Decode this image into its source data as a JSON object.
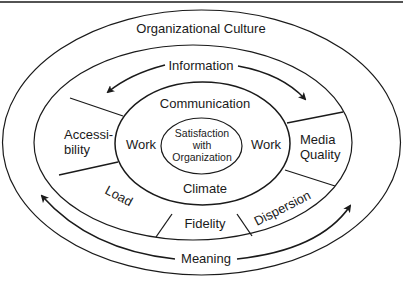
{
  "diagram": {
    "type": "concentric-ellipse",
    "colors": {
      "line": "#1a1a1a",
      "background": "#ffffff"
    },
    "rings": {
      "outer": {
        "label": "Organizational Culture"
      },
      "second": {
        "arrow_top": {
          "label": "Information",
          "direction": "bidirectional"
        },
        "arrow_bottom": {
          "label": "Meaning",
          "direction": "bidirectional"
        }
      },
      "middle_band": {
        "segments": [
          {
            "id": "accessibility",
            "line1": "Accessi-",
            "line2": "bility"
          },
          {
            "id": "media-quality",
            "line1": "Media",
            "line2": "Quality"
          },
          {
            "id": "load",
            "label": "Load"
          },
          {
            "id": "fidelity",
            "label": "Fidelity"
          },
          {
            "id": "dispersion",
            "label": "Dispersion"
          }
        ]
      },
      "inner": {
        "top": "Communication",
        "bottom": "Climate",
        "left": "Work",
        "right": "Work"
      },
      "core": {
        "line1": "Satisfaction",
        "line2": "with",
        "line3": "Organization"
      }
    }
  }
}
